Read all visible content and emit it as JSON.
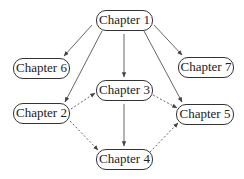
{
  "diagram": {
    "type": "chapter-dependency-graph",
    "nodes": [
      {
        "id": "ch1",
        "label": "Chapter 1"
      },
      {
        "id": "ch2",
        "label": "Chapter 2"
      },
      {
        "id": "ch3",
        "label": "Chapter 3"
      },
      {
        "id": "ch4",
        "label": "Chapter 4"
      },
      {
        "id": "ch5",
        "label": "Chapter 5"
      },
      {
        "id": "ch6",
        "label": "Chapter 6"
      },
      {
        "id": "ch7",
        "label": "Chapter 7"
      }
    ],
    "edges": [
      {
        "from": "Chapter 1",
        "to": "Chapter 6",
        "style": "solid"
      },
      {
        "from": "Chapter 1",
        "to": "Chapter 2",
        "style": "solid"
      },
      {
        "from": "Chapter 1",
        "to": "Chapter 3",
        "style": "solid"
      },
      {
        "from": "Chapter 1",
        "to": "Chapter 5",
        "style": "solid"
      },
      {
        "from": "Chapter 1",
        "to": "Chapter 7",
        "style": "solid"
      },
      {
        "from": "Chapter 2",
        "to": "Chapter 3",
        "style": "dotted"
      },
      {
        "from": "Chapter 2",
        "to": "Chapter 4",
        "style": "dotted"
      },
      {
        "from": "Chapter 3",
        "to": "Chapter 4",
        "style": "solid"
      },
      {
        "from": "Chapter 3",
        "to": "Chapter 5",
        "style": "dotted"
      },
      {
        "from": "Chapter 4",
        "to": "Chapter 5",
        "style": "dotted"
      }
    ],
    "colors": {
      "line": "#555555",
      "border": "#333333",
      "text": "#222222",
      "background": "#ffffff"
    }
  }
}
